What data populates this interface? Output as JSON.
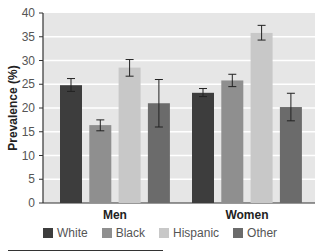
{
  "chart_data": {
    "type": "bar",
    "title": "",
    "xlabel": "",
    "ylabel": "Prevalence (%)",
    "ylim": [
      0,
      40
    ],
    "yticks": [
      0,
      5,
      10,
      15,
      20,
      25,
      30,
      35,
      40
    ],
    "grid": true,
    "legend_position": "bottom",
    "categories": [
      "Men",
      "Women"
    ],
    "series": [
      {
        "name": "White",
        "color": "#3d3d3d",
        "values": [
          24.8,
          23.2
        ],
        "error_low": [
          23.5,
          22.4
        ],
        "error_high": [
          26.2,
          24.1
        ]
      },
      {
        "name": "Black",
        "color": "#8f8f8f",
        "values": [
          16.4,
          25.8
        ],
        "error_low": [
          15.2,
          24.5
        ],
        "error_high": [
          17.5,
          27.1
        ]
      },
      {
        "name": "Hispanic",
        "color": "#c8c8c8",
        "values": [
          28.5,
          35.8
        ],
        "error_low": [
          26.7,
          34.3
        ],
        "error_high": [
          30.2,
          37.4
        ]
      },
      {
        "name": "Other",
        "color": "#6b6b6b",
        "values": [
          21.0,
          20.2
        ],
        "error_low": [
          16.0,
          17.3
        ],
        "error_high": [
          26.0,
          23.1
        ]
      }
    ]
  }
}
